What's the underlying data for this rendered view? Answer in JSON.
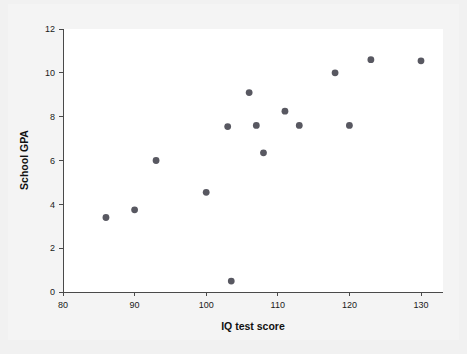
{
  "chart_data": {
    "type": "scatter",
    "title": "",
    "xlabel": "IQ test score",
    "ylabel": "School GPA",
    "xlim": [
      80,
      132
    ],
    "ylim": [
      0,
      12
    ],
    "xticks": [
      80,
      90,
      100,
      110,
      120,
      130
    ],
    "xtick_labels": [
      "80",
      "90",
      "100",
      "110",
      "120",
      "130"
    ],
    "yticks": [
      0,
      2,
      4,
      6,
      8,
      10,
      12
    ],
    "ytick_labels": [
      "0",
      "2",
      "4",
      "6",
      "8",
      "10",
      "12"
    ],
    "grid": false,
    "legend": false,
    "marker": "filled-circle",
    "marker_color": "#585861",
    "background_color": "#ffffff",
    "page_background_color": "#f1f1f1",
    "axis_color": "#4a4a4a",
    "points": [
      {
        "x": 86,
        "y": 3.4
      },
      {
        "x": 90,
        "y": 3.75
      },
      {
        "x": 93,
        "y": 6.0
      },
      {
        "x": 100,
        "y": 4.55
      },
      {
        "x": 103,
        "y": 7.55
      },
      {
        "x": 103.5,
        "y": 0.5
      },
      {
        "x": 106,
        "y": 9.1
      },
      {
        "x": 107,
        "y": 7.6
      },
      {
        "x": 108,
        "y": 6.35
      },
      {
        "x": 111,
        "y": 8.25
      },
      {
        "x": 113,
        "y": 7.6
      },
      {
        "x": 118,
        "y": 10.0
      },
      {
        "x": 120,
        "y": 7.6
      },
      {
        "x": 123,
        "y": 10.6
      },
      {
        "x": 130,
        "y": 10.55
      }
    ],
    "n_points": 15
  },
  "geometry": {
    "plot_left": 63,
    "plot_right": 443,
    "plot_top": 29,
    "plot_bottom": 292,
    "x_at_80": 63,
    "x_at_130": 421,
    "y_at_0": 292,
    "y_at_12": 29,
    "marker_radius": 3.4
  }
}
